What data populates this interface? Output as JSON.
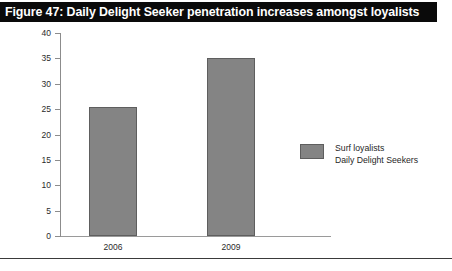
{
  "figure": {
    "title": "Figure 47: Daily Delight Seeker penetration increases amongst loyalists",
    "title_background": "#0a0a0a",
    "title_color": "#ffffff"
  },
  "chart_data": {
    "type": "bar",
    "title": "Figure 47: Daily Delight Seeker penetration increases amongst loyalists",
    "categories": [
      "2006",
      "2009"
    ],
    "values": [
      25.4,
      35.0
    ],
    "series": [
      {
        "name": "Surf loyalists Daily Delight Seekers",
        "values": [
          25.4,
          35.0
        ],
        "color": "#848484"
      }
    ],
    "xlabel": "",
    "ylabel": "",
    "ylim": [
      0,
      40
    ],
    "yticks": [
      0,
      5,
      10,
      15,
      20,
      25,
      30,
      35,
      40
    ],
    "ytick_labels": [
      "0",
      "5",
      "10",
      "15",
      "20",
      "25",
      "30",
      "35",
      "40"
    ],
    "grid": false,
    "legend": {
      "position": "center-right",
      "entries": [
        {
          "lines": [
            "Surf loyalists",
            "Daily Delight Seekers"
          ],
          "color": "#848484"
        }
      ]
    }
  },
  "legend": {
    "line1": "Surf loyalists",
    "line2": "Daily Delight Seekers"
  }
}
